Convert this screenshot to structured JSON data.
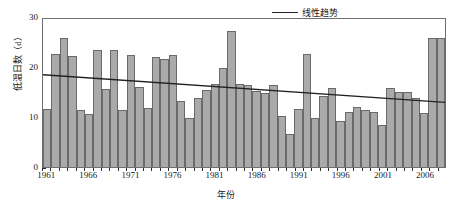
{
  "chart_data": {
    "type": "bar",
    "title": "",
    "xlabel": "年份",
    "ylabel": "低温日数（d）",
    "ylim": [
      0,
      30
    ],
    "yticks": [
      0,
      10,
      20,
      30
    ],
    "grid": false,
    "legend_position": "top-right",
    "legend": [
      {
        "name": "线性趋势",
        "type": "line",
        "color": "#222222"
      }
    ],
    "bar_color": "#aaaaaa",
    "bar_edge_color": "#6a6a6a",
    "categories": [
      "1961",
      "1962",
      "1963",
      "1964",
      "1965",
      "1966",
      "1967",
      "1968",
      "1969",
      "1970",
      "1971",
      "1972",
      "1973",
      "1974",
      "1975",
      "1976",
      "1977",
      "1978",
      "1979",
      "1980",
      "1981",
      "1982",
      "1983",
      "1984",
      "1985",
      "1986",
      "1987",
      "1988",
      "1989",
      "1990",
      "1991",
      "1992",
      "1993",
      "1994",
      "1995",
      "1996",
      "1997",
      "1998",
      "1999",
      "2000",
      "2001",
      "2002",
      "2003",
      "2004",
      "2005",
      "2006",
      "2007",
      "2008"
    ],
    "xtick_labels": [
      "1961",
      "1966",
      "1971",
      "1976",
      "1981",
      "1986",
      "1991",
      "1996",
      "2001",
      "2006"
    ],
    "series": [
      {
        "name": "低温日数",
        "values": [
          11.7,
          22.6,
          25.9,
          22.2,
          11.4,
          10.7,
          23.5,
          15.7,
          23.4,
          11.4,
          22.4,
          16.1,
          11.9,
          22.0,
          21.6,
          22.5,
          13.3,
          9.9,
          13.9,
          15.4,
          16.7,
          19.8,
          27.2,
          16.6,
          16.4,
          15.3,
          14.9,
          16.4,
          10.2,
          6.6,
          11.6,
          22.6,
          9.9,
          14.2,
          15.8,
          9.3,
          11.1,
          12.1,
          11.4,
          11.1,
          8.4,
          15.9,
          15.1,
          15.0,
          13.8,
          10.8,
          25.9,
          25.9
        ]
      }
    ],
    "trend": {
      "name": "线性趋势",
      "start_value": 18.7,
      "end_value": 13.1,
      "color": "#222222"
    }
  }
}
